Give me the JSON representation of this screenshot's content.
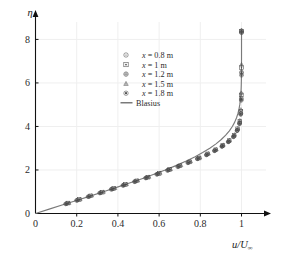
{
  "chart_data": {
    "type": "scatter",
    "title": "",
    "subtitle": "",
    "xlabel": "u/U∞",
    "ylabel": "η",
    "xlim": [
      0,
      1.08
    ],
    "ylim": [
      0,
      8.8
    ],
    "xticks": [
      "0",
      "0.2",
      "0.4",
      "0.6",
      "0.8",
      "1"
    ],
    "xtick_values": [
      0,
      0.2,
      0.4,
      0.6,
      0.8,
      1.0
    ],
    "yticks": [
      "0",
      "2",
      "4",
      "6",
      "8"
    ],
    "ytick_values": [
      0,
      2,
      4,
      6,
      8
    ],
    "grid": true,
    "grid_color": "#efefef",
    "legend_position": "upper-center-left",
    "axis_style": "arrow-ended",
    "series": [
      {
        "name": "x = 0.8 m",
        "marker": "circle-dot",
        "color": "#4a4a4a",
        "x": [
          0.152,
          0.205,
          0.262,
          0.318,
          0.374,
          0.43,
          0.486,
          0.54,
          0.594,
          0.646,
          0.696,
          0.744,
          0.79,
          0.833,
          0.872,
          0.907,
          0.938,
          0.963,
          0.98,
          0.991,
          0.997,
          0.999,
          1.0,
          1.0
        ],
        "y": [
          0.46,
          0.62,
          0.79,
          0.96,
          1.13,
          1.31,
          1.48,
          1.65,
          1.82,
          2.0,
          2.17,
          2.35,
          2.53,
          2.71,
          2.9,
          3.1,
          3.31,
          3.55,
          3.83,
          4.16,
          4.6,
          5.3,
          6.5,
          8.4
        ]
      },
      {
        "name": "x = 1 m",
        "marker": "square-dot",
        "color": "#4a4a4a",
        "x": [
          0.158,
          0.212,
          0.268,
          0.324,
          0.38,
          0.436,
          0.492,
          0.546,
          0.6,
          0.651,
          0.701,
          0.749,
          0.794,
          0.836,
          0.875,
          0.909,
          0.94,
          0.964,
          0.981,
          0.992,
          0.997,
          0.999,
          1.0,
          1.0
        ],
        "y": [
          0.48,
          0.64,
          0.81,
          0.98,
          1.15,
          1.33,
          1.5,
          1.67,
          1.84,
          2.02,
          2.19,
          2.37,
          2.55,
          2.74,
          2.93,
          3.13,
          3.35,
          3.6,
          3.89,
          4.23,
          4.7,
          5.45,
          6.7,
          8.38
        ]
      },
      {
        "name": "x = 1.2 m",
        "marker": "circle-plus",
        "color": "#4a4a4a",
        "x": [
          0.146,
          0.199,
          0.255,
          0.311,
          0.367,
          0.424,
          0.48,
          0.534,
          0.588,
          0.64,
          0.69,
          0.739,
          0.785,
          0.829,
          0.868,
          0.904,
          0.935,
          0.96,
          0.978,
          0.99,
          0.996,
          0.999,
          1.0,
          1.0
        ],
        "y": [
          0.44,
          0.6,
          0.77,
          0.94,
          1.11,
          1.29,
          1.46,
          1.63,
          1.8,
          1.98,
          2.15,
          2.33,
          2.51,
          2.69,
          2.88,
          3.08,
          3.29,
          3.52,
          3.8,
          4.12,
          4.55,
          5.2,
          6.35,
          8.3
        ]
      },
      {
        "name": "x = 1.5 m",
        "marker": "triangle",
        "color": "#4a4a4a",
        "x": [
          0.163,
          0.217,
          0.273,
          0.33,
          0.386,
          0.442,
          0.497,
          0.551,
          0.605,
          0.656,
          0.706,
          0.753,
          0.798,
          0.84,
          0.878,
          0.912,
          0.942,
          0.966,
          0.982,
          0.992,
          0.997,
          0.999,
          1.0,
          1.0
        ],
        "y": [
          0.49,
          0.66,
          0.83,
          1.0,
          1.17,
          1.35,
          1.52,
          1.69,
          1.87,
          2.04,
          2.22,
          2.4,
          2.58,
          2.76,
          2.95,
          3.16,
          3.38,
          3.63,
          3.92,
          4.28,
          4.78,
          5.55,
          6.85,
          8.42
        ]
      },
      {
        "name": "x = 1.8 m",
        "marker": "circle-filled",
        "color": "#4a4a4a",
        "x": [
          0.15,
          0.203,
          0.259,
          0.315,
          0.371,
          0.427,
          0.483,
          0.538,
          0.591,
          0.643,
          0.693,
          0.741,
          0.787,
          0.831,
          0.87,
          0.906,
          0.937,
          0.962,
          0.979,
          0.991,
          0.996,
          0.999,
          1.0,
          1.0
        ],
        "y": [
          0.45,
          0.61,
          0.78,
          0.95,
          1.12,
          1.3,
          1.47,
          1.64,
          1.81,
          1.99,
          2.16,
          2.34,
          2.52,
          2.7,
          2.89,
          3.09,
          3.3,
          3.54,
          3.82,
          4.14,
          4.58,
          5.25,
          6.45,
          8.35
        ]
      },
      {
        "name": "Blasius",
        "marker": "line",
        "color": "#7a7a7a",
        "x": [
          0.0,
          0.0664,
          0.1328,
          0.1989,
          0.2647,
          0.3298,
          0.3938,
          0.4563,
          0.5168,
          0.5748,
          0.6298,
          0.6813,
          0.729,
          0.7725,
          0.8115,
          0.846,
          0.8761,
          0.9018,
          0.9233,
          0.9411,
          0.9555,
          0.967,
          0.9759,
          0.9827,
          0.9878,
          0.9915,
          0.9942,
          0.9962,
          0.9975,
          0.9984,
          0.999,
          0.9994,
          0.9997,
          0.9998,
          0.9999,
          1.0,
          1.0,
          1.0
        ],
        "y": [
          0.0,
          0.2,
          0.4,
          0.6,
          0.8,
          1.0,
          1.2,
          1.4,
          1.6,
          1.8,
          2.0,
          2.2,
          2.4,
          2.6,
          2.8,
          3.0,
          3.2,
          3.4,
          3.6,
          3.8,
          4.0,
          4.2,
          4.4,
          4.6,
          4.8,
          5.0,
          5.2,
          5.4,
          5.6,
          5.8,
          6.0,
          6.2,
          6.4,
          6.6,
          6.8,
          7.2,
          7.8,
          8.4
        ]
      }
    ],
    "legend": [
      {
        "label": "x = 0.8 m",
        "var": "x",
        "rest": " = 0.8 m",
        "marker": "circle-dot"
      },
      {
        "label": "x = 1 m",
        "var": "x",
        "rest": " = 1 m",
        "marker": "square-dot"
      },
      {
        "label": "x = 1.2 m",
        "var": "x",
        "rest": " = 1.2 m",
        "marker": "circle-plus"
      },
      {
        "label": "x = 1.5 m",
        "var": "x",
        "rest": " = 1.5 m",
        "marker": "triangle"
      },
      {
        "label": "x = 1.8 m",
        "var": "x",
        "rest": " = 1.8 m",
        "marker": "circle-filled"
      },
      {
        "label": "Blasius",
        "var": "",
        "rest": "Blasius",
        "marker": "line"
      }
    ]
  }
}
